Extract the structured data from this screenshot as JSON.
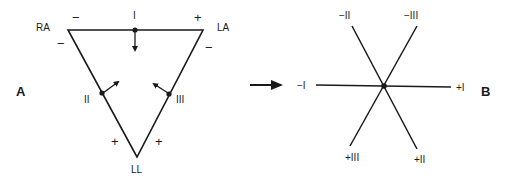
{
  "colors": {
    "ink": "#1a1a1a",
    "background": "#ffffff"
  },
  "panel_a": {
    "panel_label": "A",
    "electrodes": {
      "ra": "RA",
      "la": "LA",
      "ll": "LL"
    },
    "leads": {
      "lead_1": "I",
      "lead_2": "II",
      "lead_3": "III"
    },
    "polarity": {
      "lead_1_left": "−",
      "lead_1_right": "+",
      "lead_2_top": "−",
      "lead_2_bottom": "+",
      "lead_3_top": "−",
      "lead_3_bottom": "+"
    }
  },
  "transition_arrow": "right-arrow",
  "panel_b": {
    "panel_label": "B",
    "axis_labels": {
      "neg_1": "−I",
      "pos_1": "+I",
      "neg_2": "−II",
      "pos_2": "+II",
      "neg_3": "−III",
      "pos_3": "+III"
    }
  }
}
